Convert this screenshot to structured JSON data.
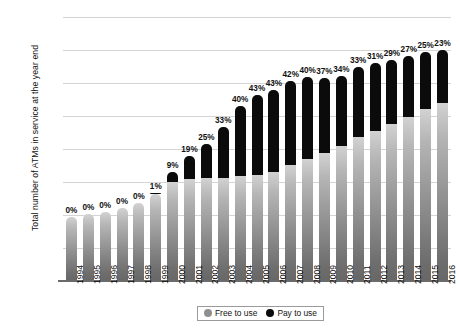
{
  "chart_data": {
    "type": "bar",
    "title": "",
    "xlabel": "",
    "ylabel": "Total number of ATMs in service at the year end",
    "ylim": [
      0,
      80000
    ],
    "ytick_step": 10000,
    "yticks": [
      "0",
      "10000",
      "20000",
      "30000",
      "40000",
      "50000",
      "60000",
      "70000",
      "80000"
    ],
    "grid": true,
    "stacked": true,
    "legend_position": "bottom",
    "categories": [
      "1994",
      "1995",
      "1996",
      "1997",
      "1998",
      "1999",
      "2000",
      "2001",
      "2002",
      "2003",
      "2004",
      "2005",
      "2006",
      "2007",
      "2008",
      "2009",
      "2010",
      "2011",
      "2012",
      "2013",
      "2014",
      "2015",
      "2016"
    ],
    "series": [
      {
        "name": "Free to use",
        "color": "#8f8f8f",
        "values": [
          19500,
          20200,
          21000,
          22200,
          23500,
          26500,
          30000,
          30800,
          31100,
          31200,
          31900,
          32200,
          33000,
          35100,
          37100,
          38900,
          41000,
          43500,
          45500,
          47600,
          49700,
          52000,
          53800
        ]
      },
      {
        "name": "Pay to use",
        "color": "#0b0b0b",
        "values": [
          0,
          0,
          0,
          0,
          0,
          270,
          2970,
          7230,
          10370,
          15370,
          21270,
          24300,
          24880,
          25500,
          24730,
          22700,
          21140,
          21430,
          20440,
          19440,
          18380,
          17330,
          16070
        ]
      }
    ],
    "totals": [
      19500,
      20200,
      21000,
      22200,
      23500,
      26770,
      32970,
      38030,
      41470,
      46570,
      53170,
      56500,
      57880,
      60600,
      61830,
      61600,
      62140,
      64930,
      65940,
      67040,
      68080,
      69330,
      69870
    ],
    "data_labels": [
      "0%",
      "0%",
      "0%",
      "0%",
      "0%",
      "1%",
      "9%",
      "19%",
      "25%",
      "33%",
      "40%",
      "43%",
      "43%",
      "42%",
      "40%",
      "37%",
      "34%",
      "33%",
      "31%",
      "29%",
      "27%",
      "25%",
      "23%"
    ],
    "data_label_note": "Percentage of ATMs that are pay to use"
  },
  "legend": {
    "items": [
      {
        "label": "Free to use",
        "swatch": "free-to-use-swatch",
        "color": "#8f8f8f"
      },
      {
        "label": "Pay to use",
        "swatch": "pay-to-use-swatch",
        "color": "#0b0b0b"
      }
    ]
  }
}
